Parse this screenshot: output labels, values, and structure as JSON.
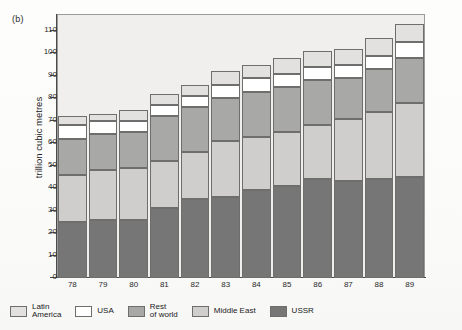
{
  "figure": {
    "panel_label": "(b)"
  },
  "chart_data": {
    "type": "bar",
    "subtype": "stacked-vertical",
    "title": "",
    "panel_label": "(b)",
    "xlabel": "",
    "ylabel": "trillion cubic metres",
    "categories": [
      "78",
      "79",
      "80",
      "81",
      "82",
      "83",
      "84",
      "85",
      "86",
      "87",
      "88",
      "89"
    ],
    "ylim": [
      0,
      110
    ],
    "yticks": [
      0,
      10,
      20,
      30,
      40,
      50,
      60,
      70,
      80,
      90,
      100,
      110
    ],
    "ytick_labels": [
      "0",
      "10",
      "20",
      "30",
      "40",
      "50",
      "60",
      "70",
      "80",
      "90",
      "100",
      "110"
    ],
    "grid": false,
    "legend_position": "below",
    "stack_order_bottom_to_top": [
      "USSR",
      "Middle East",
      "Rest of world",
      "USA",
      "Latin America"
    ],
    "series": [
      {
        "name": "USSR",
        "color": "#767676",
        "values": [
          25,
          26,
          26,
          31,
          35,
          36,
          39,
          41,
          44,
          43,
          44,
          45
        ]
      },
      {
        "name": "Middle East",
        "color": "#cfcecc",
        "values": [
          21,
          22,
          23,
          21,
          21,
          25,
          24,
          24,
          24,
          28,
          30,
          33
        ]
      },
      {
        "name": "Rest of world",
        "color": "#a8a8a6",
        "values": [
          16,
          16,
          16,
          20,
          20,
          19,
          20,
          20,
          20,
          18,
          19,
          20
        ]
      },
      {
        "name": "USA",
        "color": "#ffffff",
        "values": [
          6,
          6,
          5,
          5,
          5,
          6,
          6,
          6,
          6,
          6,
          6,
          7
        ]
      },
      {
        "name": "Latin America",
        "color": "#e2e1df",
        "values": [
          4,
          3,
          5,
          5,
          5,
          6,
          6,
          7,
          7,
          7,
          8,
          8
        ]
      }
    ],
    "totals": [
      72,
      73,
      75,
      82,
      86,
      92,
      95,
      98,
      101,
      102,
      107,
      113
    ]
  },
  "legend": {
    "items": [
      {
        "label": "Latin\nAmerica",
        "color": "#e2e1df"
      },
      {
        "label": "USA",
        "color": "#ffffff"
      },
      {
        "label": "Rest\nof world",
        "color": "#a8a8a6"
      },
      {
        "label": "Middle East",
        "color": "#cfcecc"
      },
      {
        "label": "USSR",
        "color": "#767676"
      }
    ]
  }
}
